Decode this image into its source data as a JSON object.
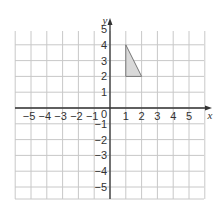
{
  "diagram": {
    "type": "coordinate-grid",
    "axes": {
      "x_label": "x",
      "y_label": "y",
      "x_range": [
        -5,
        5
      ],
      "y_range": [
        -5,
        5
      ],
      "x_ticks": [
        "-5",
        "-4",
        "-3",
        "-2",
        "-1",
        "1",
        "2",
        "3",
        "4",
        "5"
      ],
      "y_ticks": [
        "5",
        "4",
        "3",
        "2",
        "1",
        "-1",
        "-2",
        "-3",
        "-4",
        "-5"
      ],
      "origin_label": "0"
    },
    "shape": {
      "name": "triangle",
      "vertices": [
        [
          1,
          4
        ],
        [
          1,
          2
        ],
        [
          2,
          2
        ]
      ],
      "fill": "#d9d9d9",
      "stroke": "#777777"
    },
    "colors": {
      "grid": "#c8c8c8",
      "axis": "#333333",
      "background": "#ffffff"
    }
  }
}
